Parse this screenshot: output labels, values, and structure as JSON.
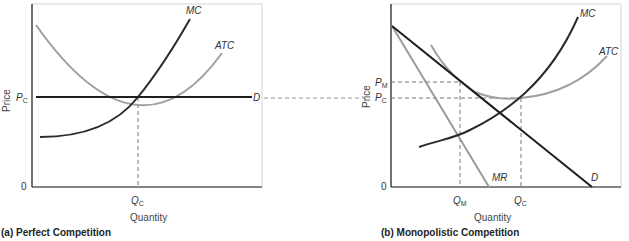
{
  "panels": [
    {
      "id": "a",
      "caption": "(a)  Perfect Competition",
      "y_axis_label": "Price",
      "x_axis_label": "Quantity",
      "origin_label": "0",
      "price_labels": [
        {
          "main": "P",
          "sub": "C"
        }
      ],
      "quantity_labels": [
        {
          "main": "Q",
          "sub": "C"
        }
      ],
      "curves": {
        "mc": "MC",
        "atc": "ATC",
        "d": "D"
      }
    },
    {
      "id": "b",
      "caption": "(b)  Monopolistic Competition",
      "y_axis_label": "Price",
      "x_axis_label": "Quantity",
      "origin_label": "0",
      "price_labels": [
        {
          "main": "P",
          "sub": "M"
        },
        {
          "main": "P",
          "sub": "C"
        }
      ],
      "quantity_labels": [
        {
          "main": "Q",
          "sub": "M"
        },
        {
          "main": "Q",
          "sub": "C"
        }
      ],
      "curves": {
        "mc": "MC",
        "atc": "ATC",
        "d": "D",
        "mr": "MR"
      }
    }
  ],
  "colors": {
    "dark_curve": "#2b2b2b",
    "light_curve": "#9a9a9a",
    "dashed": "#777777",
    "frame": "#cfcfcf"
  }
}
